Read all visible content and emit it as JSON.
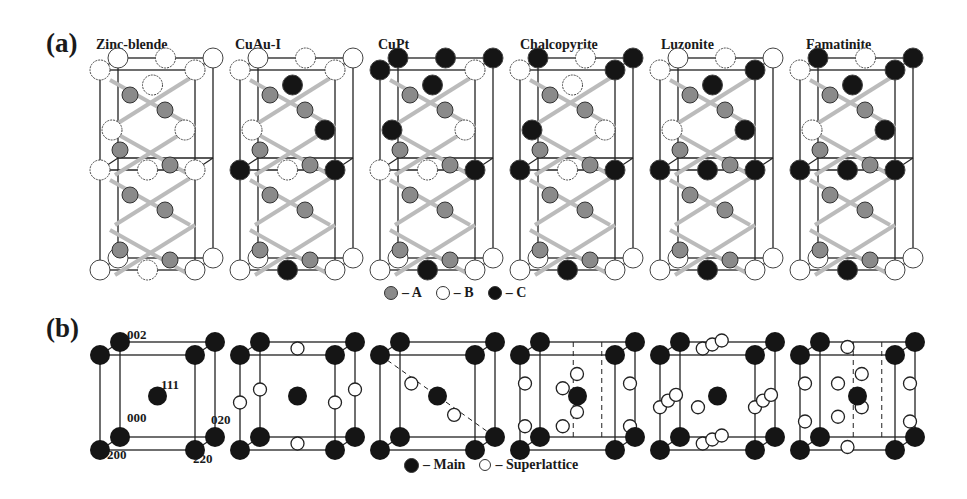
{
  "figure": {
    "panel_a": {
      "label": "(a)",
      "structures": [
        {
          "name": "Zinc-blende"
        },
        {
          "name": "CuAu-I"
        },
        {
          "name": "CuPt"
        },
        {
          "name": "Chalcopyrite"
        },
        {
          "name": "Luzonite"
        },
        {
          "name": "Famatinite"
        }
      ],
      "legend": [
        {
          "symbol": "gray-atom",
          "label": "– A",
          "color": "#8a8a8a"
        },
        {
          "symbol": "white-atom",
          "label": "– B",
          "color": "#ffffff"
        },
        {
          "symbol": "black-atom",
          "label": "– C",
          "color": "#111111"
        }
      ]
    },
    "panel_b": {
      "label": "(b)",
      "miller_indices": [
        "002",
        "111",
        "000",
        "020",
        "200",
        "220"
      ],
      "legend": [
        {
          "symbol": "main-reflection",
          "label": "– Main",
          "color": "#111111"
        },
        {
          "symbol": "superlattice-reflection",
          "label": "– Superlattice",
          "color": "#ffffff"
        }
      ]
    }
  }
}
